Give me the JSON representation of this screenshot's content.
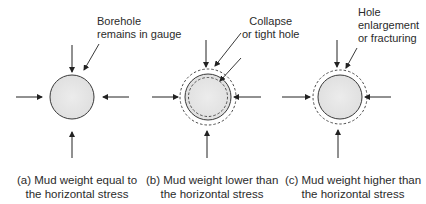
{
  "figure": {
    "panels": [
      {
        "id": "a",
        "annotation": [
          "Borehole",
          "remains in gauge"
        ],
        "caption": [
          "(a) Mud weight equal to",
          "the horizontal stress"
        ],
        "condition": "equal"
      },
      {
        "id": "b",
        "annotation": [
          "Collapse",
          "or tight hole"
        ],
        "caption": [
          "(b) Mud weight lower than",
          "the horizontal stress"
        ],
        "condition": "lower"
      },
      {
        "id": "c",
        "annotation": [
          "Hole",
          "enlargement",
          "or fracturing"
        ],
        "caption": [
          "(c) Mud weight higher than",
          "the horizontal stress"
        ],
        "condition": "higher"
      }
    ],
    "colors": {
      "borehole_fill": "#e6e6e6",
      "stroke": "#3a3a3a",
      "text": "#2b2b2b"
    }
  }
}
